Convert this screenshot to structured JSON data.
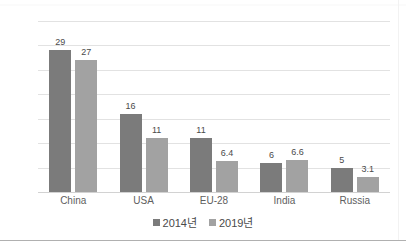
{
  "chart_data": {
    "type": "bar",
    "title": "",
    "xlabel": "",
    "ylabel": "",
    "categories": [
      "China",
      "USA",
      "EU-28",
      "India",
      "Russia"
    ],
    "series": [
      {
        "name": "2014년",
        "values": [
          29,
          16,
          11,
          6,
          5
        ],
        "color": "#7b7b7b"
      },
      {
        "name": "2019년",
        "values": [
          27,
          11,
          6.4,
          6.6,
          3.1
        ],
        "color": "#a2a2a2"
      }
    ],
    "value_labels": [
      [
        "29",
        "16",
        "11",
        "6",
        "5"
      ],
      [
        "27",
        "11",
        "6.4",
        "6.6",
        "3.1"
      ]
    ],
    "ylim": [
      0,
      35
    ],
    "yticks": [
      "0",
      "5",
      "10",
      "15",
      "20",
      "25",
      "30",
      "35"
    ],
    "ytick_values": [
      0,
      5,
      10,
      15,
      20,
      25,
      30,
      35
    ],
    "grid": true,
    "legend_position": "bottom"
  },
  "axis": {
    "y_labels": [
      "35",
      "30",
      "25",
      "20",
      "15",
      "10",
      "5",
      "0"
    ]
  },
  "legend": {
    "items": [
      {
        "label": "2014년"
      },
      {
        "label": "2019년"
      }
    ]
  },
  "title_sliver": "· ·  ·· ·"
}
